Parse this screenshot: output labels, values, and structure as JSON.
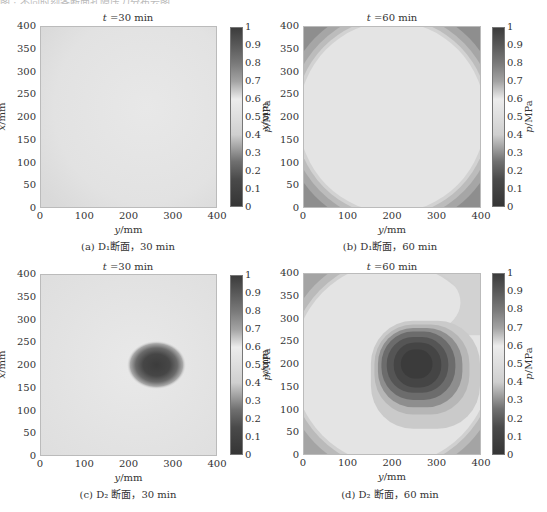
{
  "page": {
    "top_caption_fragment": "图 · 不同时刻各断面孔隙压力分布云图"
  },
  "colorbar": {
    "label": "p/MPa",
    "ticks": [
      "1",
      "0.9",
      "0.8",
      "0.7",
      "0.6",
      "0.5",
      "0.4",
      "0.3",
      "0.2",
      "0.1",
      "0"
    ]
  },
  "axes": {
    "x_label": "y/mm",
    "y_label": "x/mm",
    "x_ticks": [
      "0",
      "100",
      "200",
      "300",
      "400"
    ],
    "y_ticks": [
      "400",
      "350",
      "300",
      "250",
      "200",
      "150",
      "100",
      "50",
      "0"
    ]
  },
  "panels": [
    {
      "id": "a",
      "title": "t =30 min",
      "caption": "(a)  D₁断面，30 min"
    },
    {
      "id": "b",
      "title": "t =60 min",
      "caption": "(b)  D₁断面，60 min"
    },
    {
      "id": "c",
      "title": "t =30 min",
      "caption": "(c)  D₂ 断面，30 min"
    },
    {
      "id": "d",
      "title": "t =60 min",
      "caption": "(d)  D₂ 断面，60 min"
    }
  ],
  "chart_data": [
    {
      "type": "heatmap",
      "title": "t =30 min",
      "caption": "(a) D1断面, 30 min",
      "xlabel": "y/mm",
      "ylabel": "x/mm",
      "xlim": [
        0,
        400
      ],
      "ylim": [
        0,
        400
      ],
      "x_ticks": [
        0,
        100,
        200,
        300,
        400
      ],
      "y_ticks": [
        0,
        50,
        100,
        150,
        200,
        250,
        300,
        350,
        400
      ],
      "colorbar": {
        "label": "p/MPa",
        "range": [
          0,
          1
        ],
        "ticks": [
          0,
          0.1,
          0.2,
          0.3,
          0.4,
          0.5,
          0.6,
          0.7,
          0.8,
          0.9,
          1
        ]
      },
      "description": "Nearly uniform pressure field",
      "features": [
        {
          "kind": "uniform",
          "value_mpa": 0.45
        }
      ]
    },
    {
      "type": "heatmap",
      "title": "t =60 min",
      "caption": "(b) D1断面, 60 min",
      "xlabel": "y/mm",
      "ylabel": "x/mm",
      "xlim": [
        0,
        400
      ],
      "ylim": [
        0,
        400
      ],
      "x_ticks": [
        0,
        100,
        200,
        300,
        400
      ],
      "y_ticks": [
        0,
        50,
        100,
        150,
        200,
        250,
        300,
        350,
        400
      ],
      "colorbar": {
        "label": "p/MPa",
        "range": [
          0,
          1
        ],
        "ticks": [
          0,
          0.1,
          0.2,
          0.3,
          0.4,
          0.5,
          0.6,
          0.7,
          0.8,
          0.9,
          1
        ]
      },
      "description": "Circular uniform region with higher/lower values at the four corners",
      "features": [
        {
          "kind": "disc",
          "center": [
            200,
            200
          ],
          "radius_mm": 215,
          "value_mpa": 0.45
        },
        {
          "kind": "corners",
          "value_mpa": 0.35
        }
      ]
    },
    {
      "type": "heatmap",
      "title": "t =30 min",
      "caption": "(c) D2断面, 30 min",
      "xlabel": "y/mm",
      "ylabel": "x/mm",
      "xlim": [
        0,
        400
      ],
      "ylim": [
        0,
        400
      ],
      "x_ticks": [
        0,
        100,
        200,
        300,
        400
      ],
      "y_ticks": [
        0,
        50,
        100,
        150,
        200,
        250,
        300,
        350,
        400
      ],
      "colorbar": {
        "label": "p/MPa",
        "range": [
          0,
          1
        ],
        "ticks": [
          0,
          0.1,
          0.2,
          0.3,
          0.4,
          0.5,
          0.6,
          0.7,
          0.8,
          0.9,
          1
        ]
      },
      "description": "Uniform background with elliptical high-pressure zone",
      "features": [
        {
          "kind": "background",
          "value_mpa": 0.45
        },
        {
          "kind": "ellipse",
          "center_y_mm": 265,
          "center_x_mm": 200,
          "semi_y_mm": 60,
          "semi_x_mm": 45,
          "peak_mpa": 0.9
        }
      ]
    },
    {
      "type": "heatmap",
      "title": "t =60 min",
      "caption": "(d) D2断面, 60 min",
      "xlabel": "y/mm",
      "ylabel": "x/mm",
      "xlim": [
        0,
        400
      ],
      "ylim": [
        0,
        400
      ],
      "x_ticks": [
        0,
        100,
        200,
        300,
        400
      ],
      "y_ticks": [
        0,
        50,
        100,
        150,
        200,
        250,
        300,
        350,
        400
      ],
      "colorbar": {
        "label": "p/MPa",
        "range": [
          0,
          1
        ],
        "ticks": [
          0,
          0.1,
          0.2,
          0.3,
          0.4,
          0.5,
          0.6,
          0.7,
          0.8,
          0.9,
          1
        ]
      },
      "description": "Large high-pressure zone centered right of middle, surrounded by concentric contours, uniform disc background with darker corners",
      "features": [
        {
          "kind": "disc",
          "center": [
            200,
            200
          ],
          "radius_mm": 210,
          "value_mpa": 0.45
        },
        {
          "kind": "rounded-rect",
          "center_y_mm": 270,
          "center_x_mm": 200,
          "half_width_mm": 90,
          "half_height_mm": 75,
          "peak_mpa": 0.95
        },
        {
          "kind": "contour-ring",
          "center_y_mm": 290,
          "center_x_mm": 210,
          "half_width_mm": 125,
          "half_height_mm": 110,
          "value_mpa": 0.38
        }
      ]
    }
  ]
}
